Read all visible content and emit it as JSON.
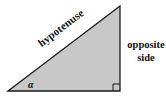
{
  "diagram": {
    "type": "right-triangle",
    "fill_color": "#c8c8c8",
    "stroke_color": "#1a1a1a",
    "vertices": {
      "angle_vertex": [
        8,
        91
      ],
      "top_vertex": [
        120,
        6
      ],
      "right_angle_vertex": [
        120,
        91
      ]
    },
    "labels": {
      "hypotenuse": "hypotenuse",
      "opposite_line1": "opposite",
      "opposite_line2": "side",
      "angle": "α"
    },
    "right_angle_marker": true
  }
}
